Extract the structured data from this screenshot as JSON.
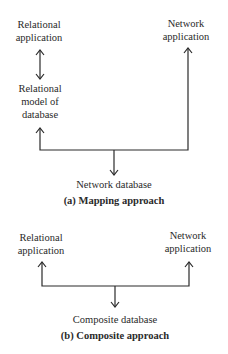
{
  "diagram_a": {
    "relational_application": [
      "Relational",
      "application"
    ],
    "network_application": [
      "Network",
      "application"
    ],
    "relational_model": [
      "Relational",
      "model of",
      "database"
    ],
    "network_database": "Network database",
    "caption": "(a) Mapping approach"
  },
  "diagram_b": {
    "relational_application": [
      "Relational",
      "application"
    ],
    "network_application": [
      "Network",
      "application"
    ],
    "composite_database": "Composite database",
    "caption": "(b) Composite approach"
  },
  "colors": {
    "line": "#2a2a2a",
    "background": "#ffffff"
  }
}
